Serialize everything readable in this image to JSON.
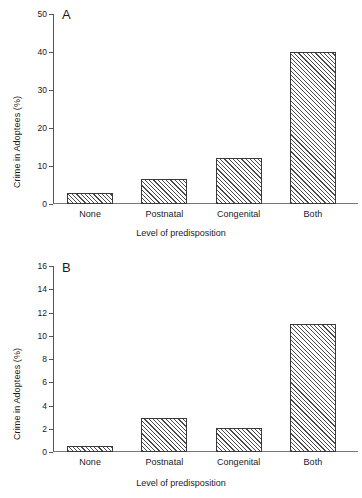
{
  "figure": {
    "background": "#ffffff",
    "bar_edge_color": "#3a3a3a",
    "hatch": "diagonal-45"
  },
  "chart_data": [
    {
      "type": "bar",
      "panel_label": "A",
      "title": "",
      "xlabel": "Level of predisposition",
      "ylabel": "Crime in Adoptees (%)",
      "categories": [
        "None",
        "Postnatal",
        "Congenital",
        "Both"
      ],
      "values": [
        2.9,
        6.7,
        12.1,
        40.0
      ],
      "ylim": [
        0,
        50
      ],
      "yticks": [
        0,
        10,
        20,
        30,
        40,
        50
      ],
      "ytick_labels": [
        "0",
        "10",
        "20",
        "30",
        "40",
        "50"
      ],
      "grid": false,
      "legend": "none"
    },
    {
      "type": "bar",
      "panel_label": "B",
      "title": "",
      "xlabel": "Level of predisposition",
      "ylabel": "Crime in Adoptees (%)",
      "categories": [
        "None",
        "Postnatal",
        "Congenital",
        "Both"
      ],
      "values": [
        0.5,
        2.9,
        2.1,
        11.0
      ],
      "ylim": [
        0,
        16
      ],
      "yticks": [
        0,
        2,
        4,
        6,
        8,
        10,
        12,
        14,
        16
      ],
      "ytick_labels": [
        "0",
        "2",
        "4",
        "6",
        "8",
        "10",
        "12",
        "14",
        "16"
      ],
      "grid": false,
      "legend": "none"
    }
  ]
}
